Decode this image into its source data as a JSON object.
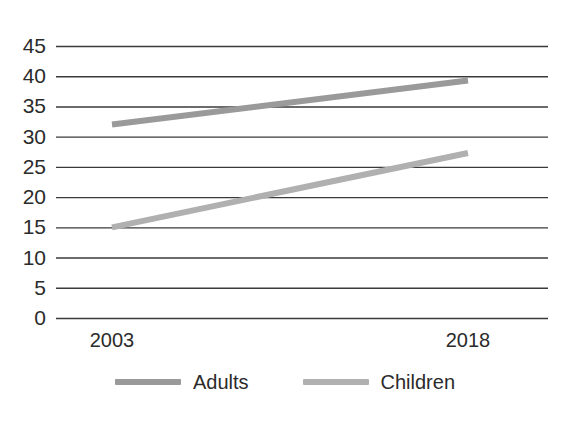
{
  "chart_data": {
    "type": "line",
    "title": "",
    "subtitle": "",
    "xlabel": "",
    "ylabel": "",
    "categories": [
      "2003",
      "2018"
    ],
    "x": [
      2003,
      2018
    ],
    "series": [
      {
        "name": "Adults",
        "values": [
          32,
          39.3
        ],
        "color": "#9a9a9a"
      },
      {
        "name": "Children",
        "values": [
          15,
          27.3
        ],
        "color": "#b0b0b0"
      }
    ],
    "ylim": [
      0,
      45
    ],
    "yticks": [
      0,
      5,
      10,
      15,
      20,
      25,
      30,
      35,
      40,
      45
    ],
    "ytick_labels": [
      "0",
      "5",
      "10",
      "15",
      "20",
      "25",
      "30",
      "35",
      "40",
      "45"
    ],
    "xtick_labels": [
      "2003",
      "2018"
    ],
    "grid": true,
    "grid_axis": "y",
    "grid_color": "#3a3a3a",
    "legend_position": "bottom",
    "legend_entries": [
      "Adults",
      "Children"
    ]
  },
  "axes": {
    "y_labels": [
      "45",
      "40",
      "35",
      "30",
      "25",
      "20",
      "15",
      "10",
      "5",
      "0"
    ],
    "x_labels": [
      "2003",
      "2018"
    ]
  },
  "legend": {
    "items": [
      {
        "label": "Adults",
        "color": "#9a9a9a"
      },
      {
        "label": "Children",
        "color": "#b0b0b0"
      }
    ]
  },
  "colors": {
    "background": "#ffffff",
    "gridline": "#3a3a3a",
    "text": "#2b2b2b",
    "series_adults": "#9a9a9a",
    "series_children": "#b0b0b0"
  }
}
